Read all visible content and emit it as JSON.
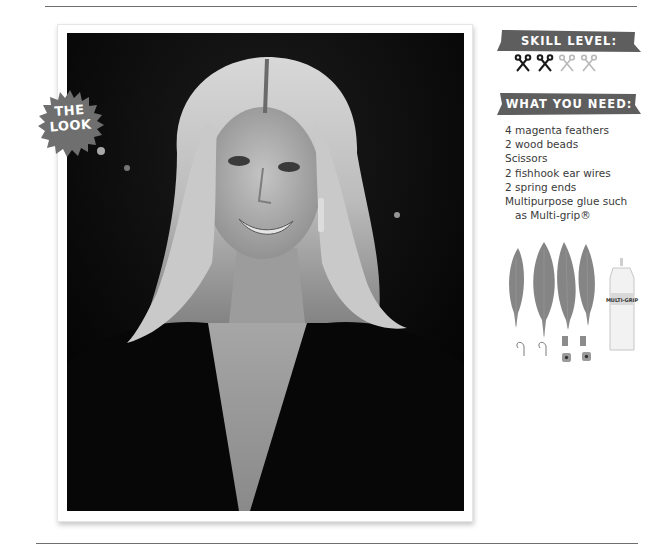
{
  "section": {
    "badge": {
      "line1": "THE",
      "line2": "LOOK",
      "color": "#6f6f6f"
    },
    "photo": {
      "description": "Black-and-white portrait of a smiling blonde woman in a deep V-neck black outfit with drop earrings"
    }
  },
  "sidebar": {
    "skill_level": {
      "title": "SKILL LEVEL:",
      "rating": 2,
      "max": 4,
      "icon": "scissors-icon",
      "active_color": "#1a1a1a",
      "inactive_color": "#b8b8b8"
    },
    "what_you_need": {
      "title": "WHAT YOU NEED:",
      "items": [
        "4 magenta feathers",
        "2 wood beads",
        "Scissors",
        "2 fishhook ear wires",
        "2 spring ends",
        "Multipurpose glue such",
        "as Multi-grip®"
      ]
    },
    "supplies_photo": {
      "glue_label": "MULTI-GRIP",
      "description": "Four feathers, glue bottle, two ear wires, two spring ends, two wood beads"
    },
    "banner_color": "#5e5e5e"
  }
}
